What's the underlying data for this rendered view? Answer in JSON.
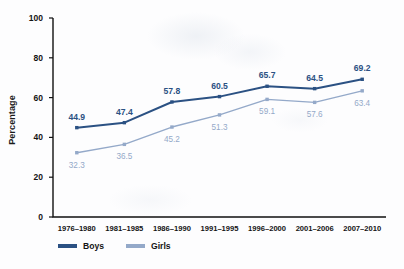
{
  "chart_data": {
    "type": "line",
    "title": "",
    "xlabel": "",
    "ylabel": "Percentage",
    "ylim": [
      0,
      100
    ],
    "yticks": [
      0,
      20,
      40,
      60,
      80,
      100
    ],
    "ytick_labels": [
      "0",
      "20",
      "40",
      "60",
      "80",
      "100"
    ],
    "grid": false,
    "legend_position": "bottom-left",
    "categories": [
      "1976–1980",
      "1981–1985",
      "1986–1990",
      "1991–1995",
      "1996–2000",
      "2001–2006",
      "2007–2010"
    ],
    "series": [
      {
        "name": "Boys",
        "color": "#2b5183",
        "values": [
          44.9,
          47.4,
          57.8,
          60.5,
          65.7,
          64.5,
          69.2
        ],
        "labels": [
          "44.9",
          "47.4",
          "57.8",
          "60.5",
          "65.7",
          "64.5",
          "69.2"
        ]
      },
      {
        "name": "Girls",
        "color": "#94a9c9",
        "values": [
          32.3,
          36.5,
          45.2,
          51.3,
          59.1,
          57.6,
          63.4
        ],
        "labels": [
          "32.3",
          "36.5",
          "45.2",
          "51.3",
          "59.1",
          "57.6",
          "63.4"
        ]
      }
    ]
  },
  "legend": {
    "items": [
      {
        "label": "Boys",
        "color": "#2b5183"
      },
      {
        "label": "Girls",
        "color": "#94a9c9"
      }
    ]
  },
  "axis": {
    "y_title": "Percentage",
    "axis_color": "#111111"
  }
}
